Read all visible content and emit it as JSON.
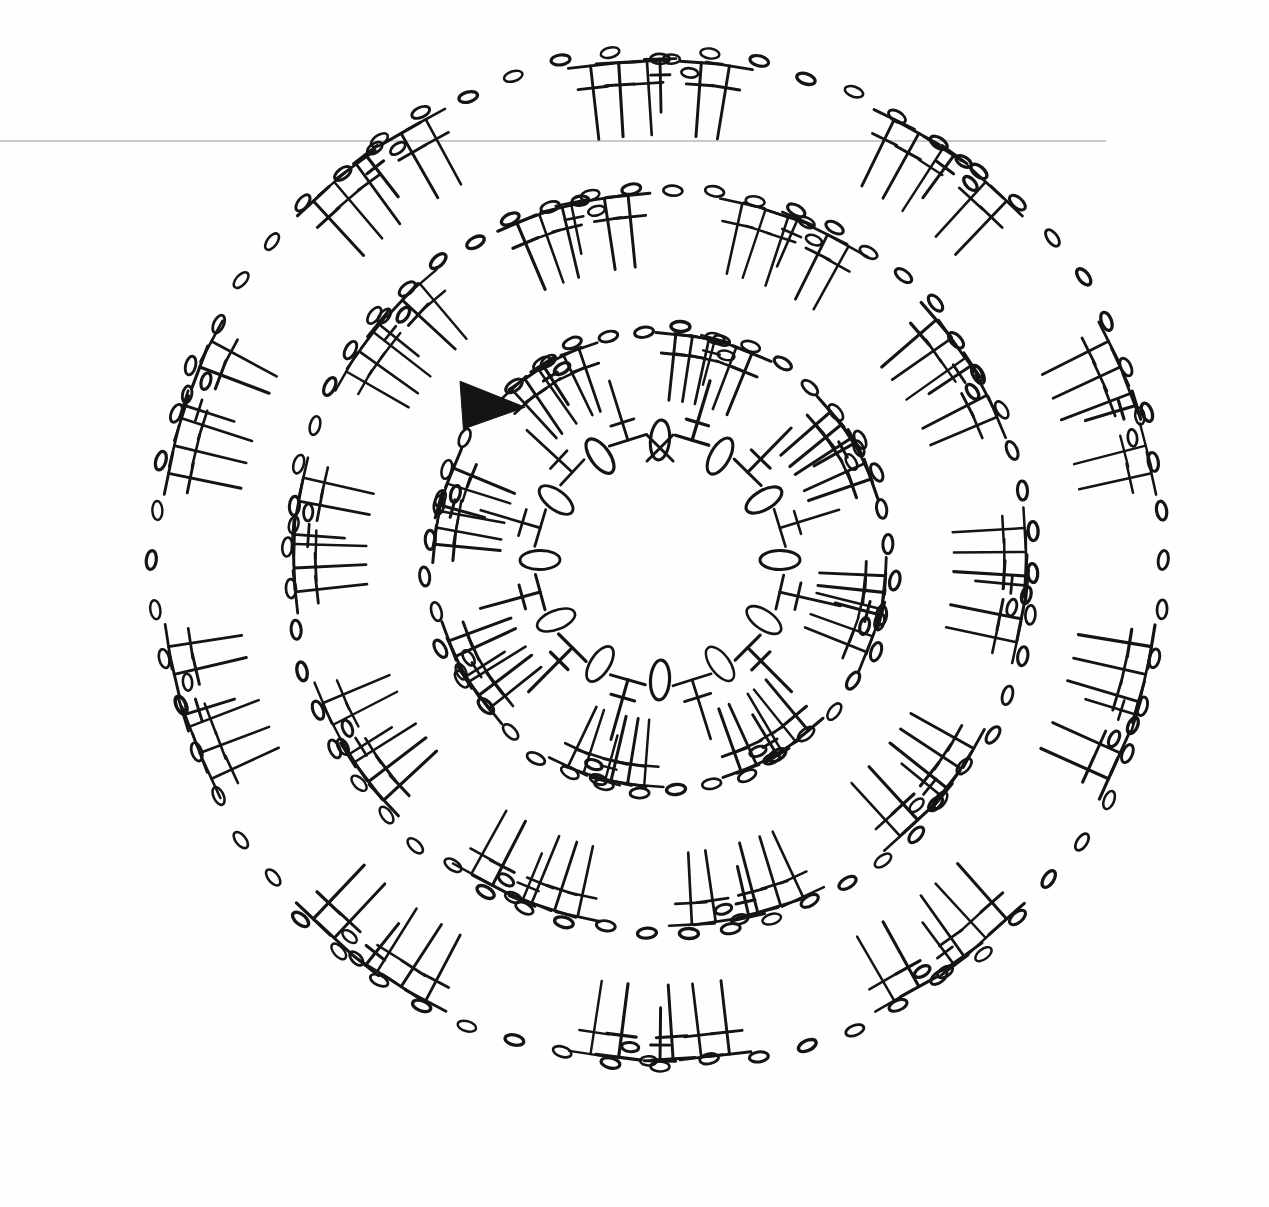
{
  "document": {
    "kind": "crochet-pattern-chart",
    "title": "Crochet Round Motif Chart",
    "background_color": "#fefefe",
    "ink_color": "#141414",
    "width": 1269,
    "height": 1207
  },
  "artifacts": {
    "scan_line": {
      "name": "scanner-edge-line",
      "color": "#b9b9b9",
      "x1": 0,
      "y1": 141,
      "x2": 1106,
      "y2": 141
    }
  },
  "marker": {
    "name": "start-marker-triangle",
    "shape": "filled-triangle",
    "direction": "right",
    "color": "#141414",
    "x": 460,
    "y": 403,
    "size": 42
  },
  "legend_symbols": [
    {
      "id": "chain",
      "glyph": "oval",
      "label": "chain stitch (ch)"
    },
    {
      "id": "single-crochet",
      "glyph": "x-cross",
      "label": "single crochet (sc)"
    },
    {
      "id": "double-crochet",
      "glyph": "t-with-one-bar",
      "label": "double crochet (dc)"
    },
    {
      "id": "treble-crochet",
      "glyph": "t-with-two-bars",
      "label": "treble crochet (tr)"
    }
  ],
  "chart_data": {
    "type": "diagram",
    "center": {
      "x": 660,
      "y": 560
    },
    "rounds": [
      {
        "index": 1,
        "name": "round-1-center-ring",
        "radius": 120,
        "rotation_offset": -90,
        "count": 12,
        "pattern": [
          "chain",
          "double-crochet"
        ],
        "join_symbol": "single-crochet",
        "join_angle": -90,
        "symbol_scale": 1.0,
        "stitch_direction": "outward"
      },
      {
        "index": 2,
        "name": "round-2-chain-arcs",
        "radius": 250,
        "rotation_offset": -94,
        "chain_count": 40,
        "chain_radius": 232,
        "fan_count": 8,
        "fan_start_angle": -76,
        "fan": {
          "groups": [
            3,
            2
          ],
          "chains_between": 2,
          "stitch": "double-crochet",
          "spread_deg": 17,
          "length": 66
        },
        "single_dc_count": 8,
        "single_dc_start_angle": -31
      },
      {
        "index": 3,
        "name": "round-3-chain-arcs",
        "radius": 390,
        "rotation_offset": -88,
        "chain_count": 56,
        "chain_radius": 372,
        "fan_count": 10,
        "fan_start_angle": -68,
        "fan": {
          "groups": [
            3,
            2
          ],
          "chains_between": 2,
          "stitch": "double-crochet",
          "spread_deg": 15,
          "length": 72
        },
        "single_dc_count": 10,
        "single_dc_start_angle": -32
      },
      {
        "index": 4,
        "name": "round-4-outer-chain-arcs",
        "radius": 520,
        "rotation_offset": -90,
        "chain_count": 64,
        "chain_radius": 505,
        "fan_count": 10,
        "fan_start_angle": -54,
        "fan": {
          "groups": [
            3,
            2
          ],
          "chains_between": 2,
          "stitch": "double-crochet",
          "spread_deg": 13,
          "length": 74
        },
        "single_dc_count": 10,
        "single_dc_start_angle": -18
      }
    ]
  }
}
